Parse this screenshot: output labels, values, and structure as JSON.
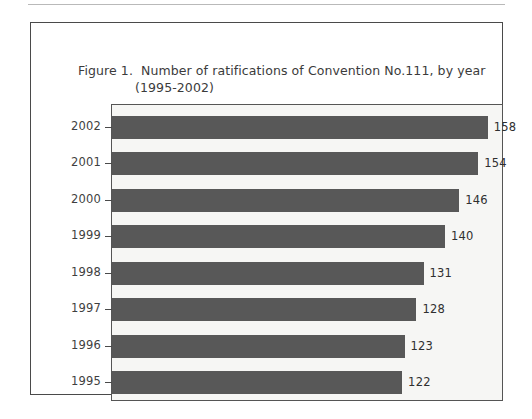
{
  "figure": {
    "caption_label": "Figure 1.",
    "caption_line1": "Number of ratifications of Convention No.111, by year",
    "caption_line2": "(1995-2002)"
  },
  "colors": {
    "bar": "#585858",
    "plot_background": "#f6f6f4",
    "frame": "#555555",
    "figure_border": "#4a4a4a",
    "text": "#3b3b3b"
  },
  "chart_data": {
    "type": "bar",
    "orientation": "horizontal",
    "title": "Figure 1.  Number of ratifications of Convention No.111, by year (1995-2002)",
    "xlabel": "",
    "ylabel": "",
    "categories": [
      "2002",
      "2001",
      "2000",
      "1999",
      "1998",
      "1997",
      "1996",
      "1995"
    ],
    "values": [
      158,
      154,
      146,
      140,
      131,
      128,
      123,
      122
    ],
    "data_labels": [
      "158",
      "154",
      "146",
      "140",
      "131",
      "128",
      "123",
      "122"
    ],
    "xlim": [
      0,
      164
    ],
    "grid": false,
    "legend": null,
    "series": [
      {
        "name": "Number of ratifications",
        "values": [
          158,
          154,
          146,
          140,
          131,
          128,
          123,
          122
        ]
      }
    ]
  }
}
